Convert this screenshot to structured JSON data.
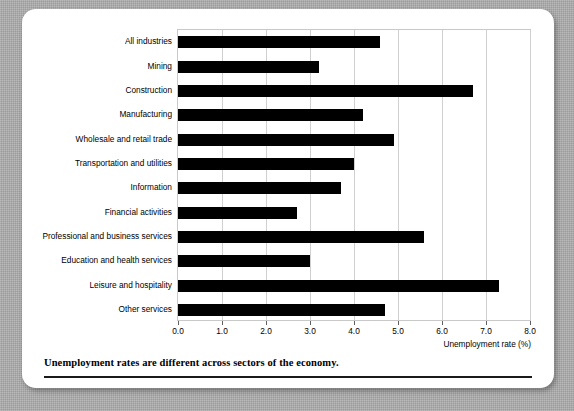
{
  "figure": {
    "caption": "Unemployment rates are different across sectors of the economy."
  },
  "chart_data": {
    "type": "bar",
    "orientation": "horizontal",
    "title": "",
    "subtitle": "",
    "xlabel": "Unemployment rate (%)",
    "ylabel": "",
    "xlim": [
      0.0,
      8.0
    ],
    "xticks": [
      "0.0",
      "1.0",
      "2.0",
      "3.0",
      "4.0",
      "5.0",
      "6.0",
      "7.0",
      "8.0"
    ],
    "grid": "vertical",
    "legend": "none",
    "bar_color": "#000000",
    "grid_color": "#d0d0d0",
    "categories": [
      "All industries",
      "Mining",
      "Construction",
      "Manufacturing",
      "Wholesale and retail trade",
      "Transportation and utilities",
      "Information",
      "Financial activities",
      "Professional and business services",
      "Education and health services",
      "Leisure and hospitality",
      "Other services"
    ],
    "values": [
      4.6,
      3.2,
      6.7,
      4.2,
      4.9,
      4.0,
      3.7,
      2.7,
      5.6,
      3.0,
      7.3,
      4.7
    ]
  }
}
